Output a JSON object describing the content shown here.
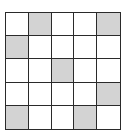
{
  "grid": {
    "rows": 5,
    "cols": 5,
    "line_color": "#2a2a2a",
    "fill_color": "#d3d3d3",
    "empty_color": "#ffffff",
    "shaded_cells": [
      [
        0,
        1
      ],
      [
        0,
        4
      ],
      [
        1,
        0
      ],
      [
        2,
        2
      ],
      [
        3,
        4
      ],
      [
        4,
        0
      ],
      [
        4,
        3
      ]
    ]
  }
}
